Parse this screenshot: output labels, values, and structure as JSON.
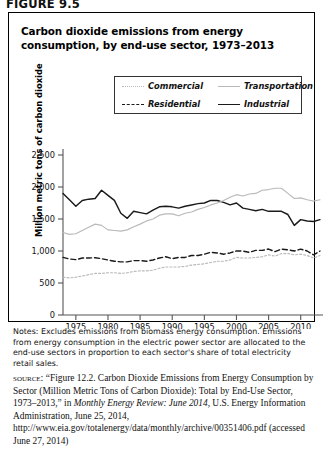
{
  "figure": {
    "label": "FIGURE 9.5",
    "title": "Carbon dioxide emissions from energy consumption, by end-use sector, 1973–2013"
  },
  "legend": {
    "entries": [
      {
        "label": "Commercial",
        "color": "#b9b9b9",
        "dash": "2,2",
        "style": "dotted-light"
      },
      {
        "label": "Transportation",
        "color": "#b9b9b9",
        "dash": "",
        "style": "solid-light"
      },
      {
        "label": "Residential",
        "color": "#1a1a1a",
        "dash": "5,3",
        "style": "dashed-dark"
      },
      {
        "label": "Industrial",
        "color": "#1a1a1a",
        "dash": "",
        "style": "solid-dark"
      }
    ]
  },
  "notes": "Notes: Excludes emissions from biomass energy consumption. Emissions from energy consumption in the electric power sector are allocated to the end-use sectors in proportion to each sector's share of total electricity retail sales.",
  "source": {
    "kicker": "source:",
    "text_1": "“Figure 12.2. Carbon Dioxide Emissions from Energy Consumption by Sector (Million Metric Tons of Carbon Dioxide): Total by End-Use Sector, 1973–2013,” in ",
    "italic_1": "Monthly Energy Review: June 2014,",
    "text_2": " U.S. Energy Information Administration, June 25, 2014, http://www.eia.gov/totalenergy/data/monthly/archive/00351406.pdf (accessed June 27, 2014)"
  },
  "chart_data": {
    "type": "line",
    "title": "Carbon dioxide emissions from energy consumption, by end-use sector, 1973–2013",
    "xlabel": "",
    "ylabel": "Million metric tons of carbon dioxide",
    "xlim": [
      1973,
      2013
    ],
    "ylim": [
      0,
      2500
    ],
    "yticks": [
      0,
      500,
      1000,
      1500,
      2000,
      2500
    ],
    "ytick_labels": [
      "0",
      "500",
      "1,000",
      "1,500",
      "2,000",
      "2,500"
    ],
    "xticks": [
      1975,
      1980,
      1985,
      1990,
      1995,
      2000,
      2005,
      2010
    ],
    "xtick_labels": [
      "1975",
      "1980",
      "1985",
      "1990",
      "1995",
      "2000",
      "2005",
      "2010"
    ],
    "grid": false,
    "legend_position": "top-center",
    "x": [
      1973,
      1974,
      1975,
      1976,
      1977,
      1978,
      1979,
      1980,
      1981,
      1982,
      1983,
      1984,
      1985,
      1986,
      1987,
      1988,
      1989,
      1990,
      1991,
      1992,
      1993,
      1994,
      1995,
      1996,
      1997,
      1998,
      1999,
      2000,
      2001,
      2002,
      2003,
      2004,
      2005,
      2006,
      2007,
      2008,
      2009,
      2010,
      2011,
      2012,
      2013
    ],
    "series": [
      {
        "name": "Industrial",
        "color": "#1a1a1a",
        "dash": "",
        "values": [
          1900,
          1800,
          1700,
          1790,
          1810,
          1820,
          1950,
          1870,
          1790,
          1590,
          1510,
          1620,
          1600,
          1580,
          1640,
          1690,
          1700,
          1690,
          1670,
          1700,
          1720,
          1740,
          1750,
          1790,
          1790,
          1760,
          1720,
          1750,
          1670,
          1650,
          1630,
          1650,
          1620,
          1620,
          1620,
          1570,
          1400,
          1490,
          1470,
          1460,
          1490
        ]
      },
      {
        "name": "Transportation",
        "color": "#b9b9b9",
        "dash": "",
        "values": [
          1290,
          1260,
          1270,
          1320,
          1370,
          1420,
          1400,
          1330,
          1320,
          1310,
          1330,
          1380,
          1420,
          1470,
          1500,
          1560,
          1580,
          1580,
          1550,
          1590,
          1610,
          1650,
          1680,
          1720,
          1750,
          1790,
          1840,
          1880,
          1860,
          1890,
          1900,
          1950,
          1960,
          1980,
          1980,
          1900,
          1820,
          1830,
          1800,
          1780,
          1800
        ]
      },
      {
        "name": "Residential",
        "color": "#1a1a1a",
        "dash": "5,3",
        "values": [
          900,
          875,
          865,
          890,
          890,
          895,
          880,
          860,
          840,
          830,
          830,
          850,
          850,
          840,
          860,
          890,
          910,
          880,
          900,
          900,
          930,
          930,
          950,
          980,
          970,
          950,
          970,
          1000,
          1000,
          980,
          1010,
          1010,
          1030,
          990,
          1030,
          1020,
          1000,
          1030,
          1000,
          940,
          1000
        ]
      },
      {
        "name": "Commercial",
        "color": "#b9b9b9",
        "dash": "2,2",
        "values": [
          590,
          580,
          590,
          610,
          630,
          650,
          650,
          660,
          660,
          650,
          660,
          680,
          690,
          690,
          700,
          730,
          750,
          750,
          750,
          760,
          780,
          790,
          800,
          820,
          840,
          840,
          860,
          900,
          890,
          890,
          900,
          910,
          940,
          920,
          960,
          960,
          940,
          950,
          930,
          890,
          930
        ]
      }
    ]
  }
}
